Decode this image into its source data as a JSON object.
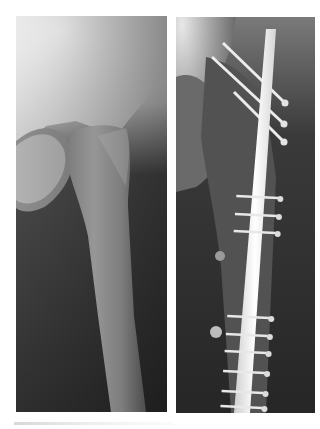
{
  "figure": {
    "type": "radiograph-pair",
    "panels": [
      {
        "id": "left",
        "subject": "hip-femur-preoperative",
        "description": "Proximal femur and hip joint, no implant"
      },
      {
        "id": "right",
        "subject": "hip-femur-postoperative",
        "description": "Proximal femur with intramedullary nail, 3 proximal oblique screws and multiple distal locking screws"
      }
    ],
    "implant": {
      "proximal_screws": 3,
      "distal_screw_pairs": 9
    },
    "colors": {
      "background": "#ffffff",
      "bone_light": "#e9e9e9",
      "soft_tissue_dark": "#2b2b2b",
      "implant": "#f7f7f7"
    }
  }
}
